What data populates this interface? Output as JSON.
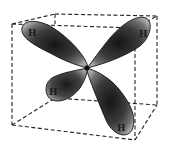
{
  "diagram": {
    "center": {
      "x": 87,
      "y": 68
    },
    "colors": {
      "background": "#ffffff",
      "cube_line": "#222222",
      "lobe_dark": "#1e1e1e",
      "lobe_mid": "#555555",
      "lobe_light": "#9a9a9a",
      "lobe_outline": "#111111"
    },
    "lobes": [
      {
        "id": "upper-left",
        "label": "H",
        "label_x": 31,
        "label_y": 36
      },
      {
        "id": "upper-right",
        "label": "H",
        "label_x": 142,
        "label_y": 37
      },
      {
        "id": "lower-left",
        "label": "H",
        "label_x": 52,
        "label_y": 94
      },
      {
        "id": "lower-right",
        "label": "H",
        "label_x": 120,
        "label_y": 130
      }
    ]
  }
}
